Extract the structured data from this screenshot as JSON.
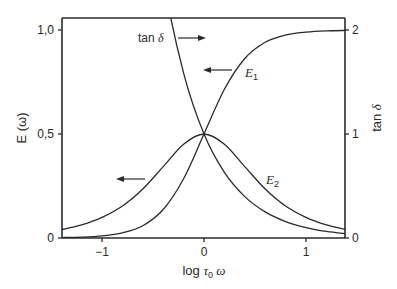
{
  "chart_data": {
    "type": "line",
    "title": "",
    "xlabel": "log τ₀ ω",
    "ylabel": "E (ω)",
    "y2label": "tan δ",
    "xlim": [
      -1.39,
      1.39
    ],
    "ylim": [
      0,
      1.06
    ],
    "y2lim": [
      0,
      2.12
    ],
    "grid": false,
    "legend": "inline labels",
    "x_ticks": [
      -1,
      0,
      1
    ],
    "x_tick_labels": [
      "−1",
      "0",
      "1"
    ],
    "y_ticks": [
      0,
      0.5,
      1.0
    ],
    "y_tick_labels": [
      "0",
      "0,5",
      "1,0"
    ],
    "y2_ticks": [
      0,
      1,
      2
    ],
    "y2_tick_labels": [
      "0",
      "1",
      "2"
    ],
    "x": [
      -1.4,
      -1.2,
      -1.0,
      -0.8,
      -0.6,
      -0.4,
      -0.2,
      0,
      0.2,
      0.4,
      0.6,
      0.8,
      1.0,
      1.2,
      1.4
    ],
    "series": [
      {
        "name": "E1",
        "axis": "left",
        "values": [
          0.002,
          0.004,
          0.01,
          0.025,
          0.059,
          0.137,
          0.285,
          0.5,
          0.715,
          0.863,
          0.941,
          0.976,
          0.99,
          0.996,
          0.998
        ]
      },
      {
        "name": "E2",
        "axis": "left",
        "values": [
          0.04,
          0.063,
          0.099,
          0.154,
          0.236,
          0.343,
          0.451,
          0.5,
          0.451,
          0.343,
          0.236,
          0.154,
          0.099,
          0.063,
          0.04
        ]
      },
      {
        "name": "tan δ",
        "axis": "right",
        "values": [
          25.1,
          15.85,
          10.0,
          6.31,
          3.98,
          2.51,
          1.585,
          1.0,
          0.631,
          0.398,
          0.251,
          0.158,
          0.1,
          0.063,
          0.04
        ]
      }
    ],
    "annotations": [
      {
        "text": "tan δ",
        "arrow": "right",
        "note": "read on right axis"
      },
      {
        "text": "E1",
        "arrow": "left",
        "note": "read on left axis"
      },
      {
        "text": "E2",
        "arrow": "left",
        "note": "read on left axis"
      }
    ]
  },
  "labels": {
    "y_axis_title": "E (ω)",
    "y2_axis_title_main": "tan ",
    "y2_axis_title_sym": "δ",
    "x_axis_title_main": "log ",
    "x_axis_title_tau": "τ",
    "x_axis_title_sub": "0",
    "x_axis_title_omega": " ω",
    "tan_label_main": "tan ",
    "tan_label_sym": "δ",
    "e1_label": "E",
    "e1_sub": "1",
    "e2_label": "E",
    "e2_sub": "2"
  }
}
